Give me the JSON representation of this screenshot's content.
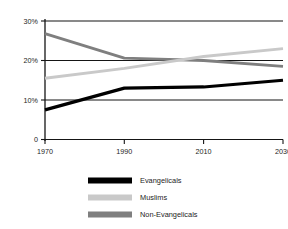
{
  "chart_data": {
    "type": "line",
    "title": "",
    "subtitle": "",
    "xlabel": "",
    "ylabel": "",
    "x": [
      1970,
      1990,
      2010,
      2030
    ],
    "xtick_labels": [
      "1970",
      "1990",
      "2010",
      "2030"
    ],
    "ytick_labels": [
      "0",
      "10%",
      "20%",
      "30%"
    ],
    "ytick_values": [
      0,
      10,
      20,
      30
    ],
    "ylim": [
      0,
      30
    ],
    "xlim": [
      1970,
      2030
    ],
    "grid": "horizontal",
    "legend_position": "bottom",
    "series": [
      {
        "name": "Evangelicals",
        "color": "#000000",
        "values": [
          7.5,
          13.0,
          13.3,
          15.0
        ]
      },
      {
        "name": "Muslims",
        "color": "#c9c9c9",
        "values": [
          15.5,
          18.0,
          21.0,
          23.0
        ]
      },
      {
        "name": "Non-Evangelicals",
        "color": "#7f7f7f",
        "values": [
          26.8,
          20.6,
          20.0,
          18.5
        ]
      }
    ]
  },
  "axis": {
    "y_labels": [
      "30%",
      "20%",
      "10%",
      "0"
    ],
    "x_labels": [
      "1970",
      "1990",
      "2010",
      "2030"
    ]
  },
  "legend": {
    "items": [
      {
        "label": "Evangelicals",
        "color": "#000000"
      },
      {
        "label": "Muslims",
        "color": "#c9c9c9"
      },
      {
        "label": "Non-Evangelicals",
        "color": "#7f7f7f"
      }
    ]
  },
  "colors": {
    "background": "#ffffff",
    "axis": "#151515",
    "grid": "#151515",
    "evangelicals": "#000000",
    "muslims": "#c9c9c9",
    "non_evangelicals": "#7f7f7f"
  }
}
